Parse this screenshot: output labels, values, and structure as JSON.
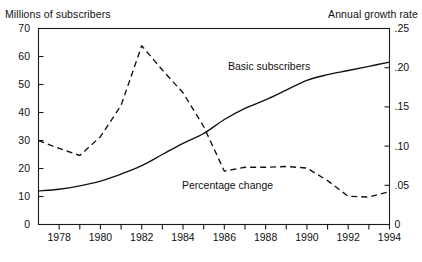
{
  "chart_data": {
    "type": "line",
    "title": "",
    "xlabel": "",
    "ylabel": "Millions of subscribers",
    "y2label": "Annual growth rate",
    "grid": false,
    "legend_position": "inline-annotations",
    "x": [
      1977,
      1978,
      1979,
      1980,
      1981,
      1982,
      1983,
      1984,
      1985,
      1986,
      1987,
      1988,
      1989,
      1990,
      1991,
      1992,
      1993,
      1994
    ],
    "xlim": [
      1977,
      1994
    ],
    "xticks": [
      1977,
      1978,
      1979,
      1980,
      1981,
      1982,
      1983,
      1984,
      1985,
      1986,
      1987,
      1988,
      1989,
      1990,
      1991,
      1992,
      1993,
      1994
    ],
    "xticklabels": [
      "1978",
      "1980",
      "1982",
      "1984",
      "1986",
      "1988",
      "1990",
      "1992",
      "1994"
    ],
    "xticklabel_years": [
      1978,
      1980,
      1982,
      1984,
      1986,
      1988,
      1990,
      1992,
      1994
    ],
    "ylim": [
      0,
      70
    ],
    "yticks": [
      0,
      10,
      20,
      30,
      40,
      50,
      60,
      70
    ],
    "yticklabels": [
      "0",
      "10",
      "20",
      "30",
      "40",
      "50",
      "60",
      "70"
    ],
    "y2lim": [
      0,
      0.25
    ],
    "y2ticks": [
      0,
      0.05,
      0.1,
      0.15,
      0.2,
      0.25
    ],
    "y2ticklabels": [
      "0",
      ".05",
      ".10",
      ".15",
      ".20",
      ".25"
    ],
    "series": [
      {
        "name": "Basic subscribers",
        "axis": "left",
        "style": "solid",
        "units": "millions",
        "values": [
          12.0,
          12.6,
          13.8,
          15.5,
          18.0,
          21.0,
          25.0,
          29.0,
          32.5,
          37.5,
          41.5,
          44.5,
          48.0,
          51.5,
          53.5,
          55.0,
          56.5,
          58.0
        ]
      },
      {
        "name": "Percentage change",
        "axis": "right",
        "style": "dashed",
        "units": "fraction",
        "values": [
          0.107,
          0.097,
          0.088,
          0.112,
          0.152,
          0.228,
          0.197,
          0.168,
          0.125,
          0.068,
          0.073,
          0.073,
          0.074,
          0.072,
          0.056,
          0.036,
          0.035,
          0.042
        ]
      }
    ],
    "annotations": [
      {
        "text": "Basic subscribers",
        "series": "Basic subscribers",
        "x": 1988.5,
        "y": 52
      },
      {
        "text": "Percentage change",
        "series": "Percentage change",
        "x": 1985.5,
        "y": 0.05
      }
    ]
  }
}
